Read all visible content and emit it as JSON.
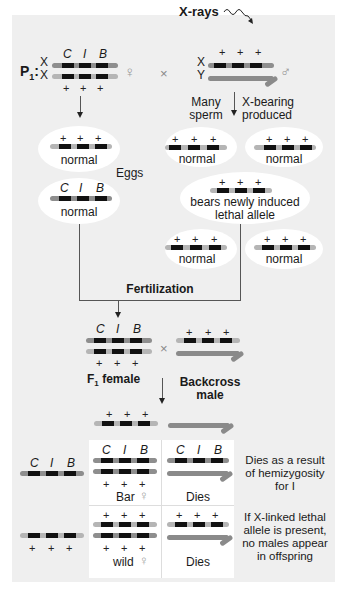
{
  "diagram": {
    "title_xrays": "X-rays",
    "p1_label": "P",
    "p1_sub": "1",
    "p1_colon": ":",
    "x_label": "X",
    "y_label": "Y",
    "female_symbol": "♀",
    "male_symbol": "♂",
    "cross_symbol": "×",
    "plus": "+",
    "alleles": {
      "c": "C",
      "i": "I",
      "b": "B"
    },
    "sperm_note_left": [
      "Many",
      "sperm"
    ],
    "sperm_note_right": [
      "X-bearing",
      "produced"
    ],
    "eggs_label": "Eggs",
    "egg_labels": [
      "normal",
      "normal"
    ],
    "sperm_labels": [
      "normal",
      "normal",
      "normal",
      "normal"
    ],
    "lethal_label_line1": "bears newly induced",
    "lethal_label_line2": "lethal allele",
    "fertilization_label": "Fertilization",
    "f1_female_label": "F",
    "f1_sub": "1",
    "f1_female_suffix": " female",
    "backcross_label_line1": "Backcross",
    "backcross_label_line2": "male",
    "table": {
      "row1_left_caption": "Bar",
      "row1_right_caption": "Dies",
      "row2_left_caption": "wild",
      "row2_right_caption": "Dies"
    },
    "note1": [
      "Dies as a result",
      "of hemizygosity",
      "for I"
    ],
    "note2": [
      "If X-linked lethal",
      "allele is present,",
      "no males appear",
      "in offspring"
    ],
    "colors": {
      "panel_bg": "#efefef",
      "chromosome_light": "#b5b5b5",
      "chromosome_dark": "#8e8e8e",
      "band": "#111111",
      "ellipse": "#ffffff"
    }
  }
}
